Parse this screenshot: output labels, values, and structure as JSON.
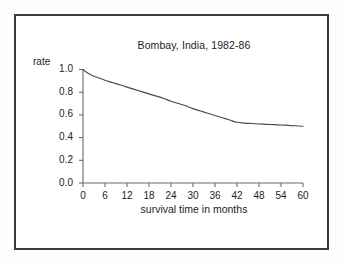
{
  "figure": {
    "background_color": "#fdfdfd",
    "panel_color": "#ffffff",
    "border_color": "#3a3a3c",
    "ink_color": "#1d1d1d"
  },
  "chart_data": {
    "type": "line",
    "title": "Bombay, India, 1982-86",
    "xlabel": "survival time in months",
    "ylabel": "rate",
    "xlim": [
      0,
      60
    ],
    "ylim": [
      0.0,
      1.0
    ],
    "grid": false,
    "legend": "none",
    "xticks": [
      0,
      6,
      12,
      18,
      24,
      30,
      36,
      42,
      48,
      54,
      60
    ],
    "xtick_labels": [
      "0",
      "6",
      "12",
      "18",
      "24",
      "30",
      "36",
      "42",
      "48",
      "54",
      "60"
    ],
    "yticks": [
      0.0,
      0.2,
      0.4,
      0.6,
      0.8,
      1.0
    ],
    "ytick_labels": [
      "0.0",
      "0.2",
      "0.4",
      "0.6",
      "0.8",
      "1.0"
    ],
    "series": [
      {
        "name": "survival rate",
        "color": "#4a4a4a",
        "x": [
          0,
          1,
          2,
          3,
          4,
          6,
          8,
          10,
          12,
          14,
          16,
          18,
          20,
          22,
          24,
          26,
          28,
          30,
          32,
          34,
          36,
          38,
          40,
          42,
          44,
          46,
          48,
          50,
          52,
          54,
          56,
          58,
          60
        ],
        "y": [
          1.0,
          0.975,
          0.955,
          0.94,
          0.93,
          0.905,
          0.885,
          0.865,
          0.845,
          0.825,
          0.805,
          0.785,
          0.765,
          0.745,
          0.72,
          0.7,
          0.68,
          0.655,
          0.635,
          0.615,
          0.595,
          0.575,
          0.555,
          0.535,
          0.528,
          0.524,
          0.52,
          0.517,
          0.514,
          0.511,
          0.508,
          0.504,
          0.5
        ]
      }
    ]
  }
}
